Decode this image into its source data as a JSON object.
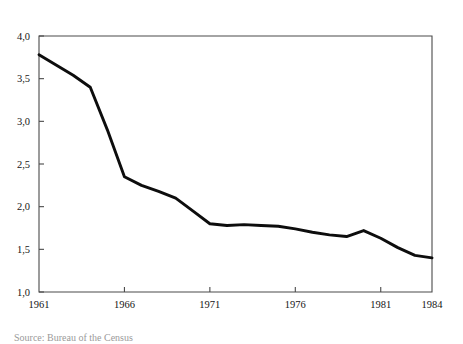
{
  "figure": {
    "caption": "Source: Bureau of the Census"
  },
  "chart_data": {
    "type": "line",
    "title": "",
    "subtitle": "",
    "xlabel": "",
    "ylabel": "",
    "xlim": [
      1961,
      1984
    ],
    "ylim": [
      1.0,
      4.0
    ],
    "grid": false,
    "legend": "none",
    "decimal_separator": ",",
    "line_color": "#0d0d0d",
    "axis_color": "#4a4a4a",
    "x_tick_values": [
      1961,
      1966,
      1971,
      1976,
      1981,
      1984
    ],
    "x_tick_labels": [
      "1961",
      "1966",
      "1971",
      "1976",
      "1981",
      "1984"
    ],
    "y_tick_values": [
      1.0,
      1.5,
      2.0,
      2.5,
      3.0,
      3.5,
      4.0
    ],
    "y_tick_labels": [
      "1,0",
      "1,5",
      "2,0",
      "2,5",
      "3,0",
      "3,5",
      "4,0"
    ],
    "x": [
      1961,
      1962,
      1963,
      1964,
      1965,
      1966,
      1967,
      1968,
      1969,
      1970,
      1971,
      1972,
      1973,
      1974,
      1975,
      1976,
      1977,
      1978,
      1979,
      1980,
      1981,
      1982,
      1983,
      1984
    ],
    "values": [
      3.78,
      3.66,
      3.54,
      3.4,
      2.9,
      2.35,
      2.25,
      2.18,
      2.1,
      1.95,
      1.8,
      1.78,
      1.79,
      1.78,
      1.77,
      1.74,
      1.7,
      1.67,
      1.65,
      1.72,
      1.63,
      1.52,
      1.43,
      1.4
    ],
    "series": [
      {
        "name": "series-1",
        "values": [
          3.78,
          3.66,
          3.54,
          3.4,
          2.9,
          2.35,
          2.25,
          2.18,
          2.1,
          1.95,
          1.8,
          1.78,
          1.79,
          1.78,
          1.77,
          1.74,
          1.7,
          1.67,
          1.65,
          1.72,
          1.63,
          1.52,
          1.43,
          1.4
        ]
      }
    ]
  }
}
